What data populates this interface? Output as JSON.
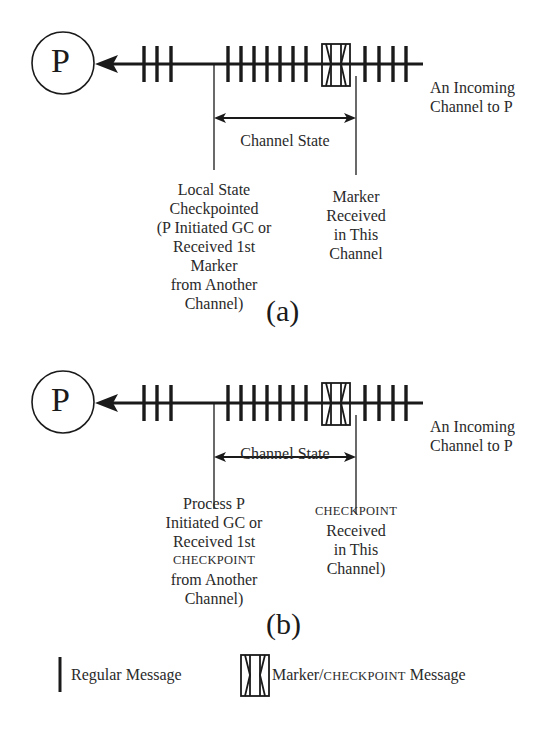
{
  "diagram_a": {
    "process_label": "P",
    "channel_label": [
      "An Incoming",
      "Channel to P"
    ],
    "channel_state_label": "Channel State",
    "left_annotation": [
      "Local State",
      "Checkpointed",
      "(P Initiated GC or",
      "Received 1st",
      "Marker",
      "from Another",
      "Channel)"
    ],
    "right_annotation": [
      "Marker",
      "Received",
      "in This",
      "Channel"
    ],
    "caption": "(a)",
    "message_groups": {
      "before_cut": 3,
      "channel_state": 7,
      "after_marker": 4
    }
  },
  "diagram_b": {
    "process_label": "P",
    "channel_label": [
      "An Incoming",
      "Channel to P"
    ],
    "channel_state_label": "Channel State",
    "left_annotation": [
      "Process P",
      "Initiated GC or",
      "Received 1st",
      "CHECKPOINT",
      "from Another",
      "Channel)"
    ],
    "right_annotation": [
      "CHECKPOINT",
      "Received",
      "in This",
      "Channel)"
    ],
    "caption": "(b)",
    "message_groups": {
      "before_cut": 3,
      "channel_state": 7,
      "after_marker": 4
    }
  },
  "legend": {
    "regular": "Regular Message",
    "marker_prefix": "Marker/",
    "marker_sc": "CHECKPOINT",
    "marker_suffix": " Message"
  }
}
